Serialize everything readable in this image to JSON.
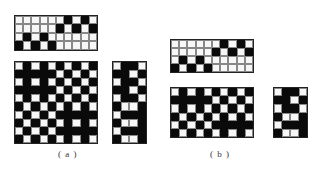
{
  "figure": {
    "panels": [
      {
        "id": "a",
        "label": "( a )",
        "grids": [
          {
            "name": "threading-draft",
            "rows": [
              "WWWWWWBWBW",
              "WWWWWBWBWB",
              "WBWBWWWWWW",
              "BWBWBWWWWW"
            ]
          },
          {
            "name": "weave-pattern",
            "rows": [
              "WBWBWBWBWB",
              "BBBBBWBWBW",
              "WBWBWBWBWB",
              "BBBBBWBWBW",
              "WBWBWBWBWB",
              "BWBWBWBWBW",
              "WBWBWBBBBB",
              "BWBWBWBWBW",
              "WBWBWBBBBB",
              "BWBWBWBWBW"
            ]
          },
          {
            "name": "treadling-draft",
            "rows": [
              "WBBW",
              "BBWB",
              "WBBW",
              "BBWB",
              "WBBW",
              "BWWB",
              "WBBB",
              "BWWB",
              "WBBB",
              "BWWB"
            ]
          }
        ]
      },
      {
        "id": "b",
        "label": "( b )",
        "grids": [
          {
            "name": "threading-draft",
            "rows": [
              "WWWWWWBWBW",
              "WWWWWBWBWB",
              "WBWBWWWWWW",
              "BWBWBWWWWW"
            ]
          },
          {
            "name": "weave-pattern",
            "rows": [
              "WBWBWBWBWB",
              "BBBBBWBWBW",
              "WBWBWBWBWB",
              "BWBWBWBWBW",
              "WBWBWBBBBB",
              "BWBWBWBWBW"
            ]
          },
          {
            "name": "treadling-draft",
            "rows": [
              "WBBW",
              "BBWB",
              "WBBW",
              "BWWB",
              "WBBB",
              "BWWB"
            ]
          }
        ]
      }
    ]
  },
  "colors": {
    "filled": "#0a0a0a",
    "empty": "#f7f7f7",
    "gridline": "#888888"
  }
}
